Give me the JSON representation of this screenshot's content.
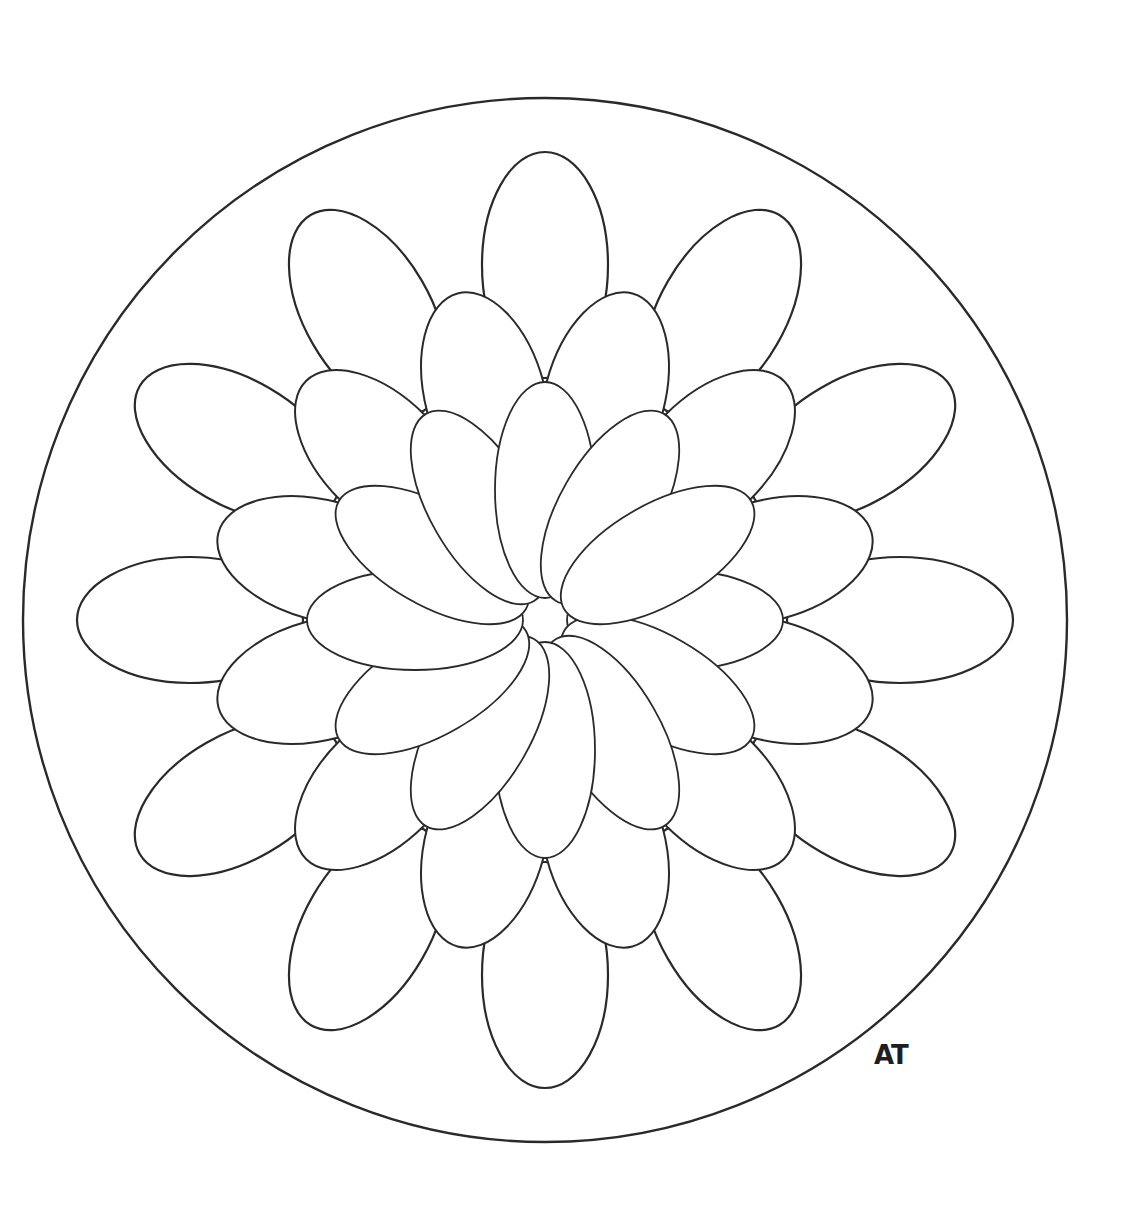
{
  "artwork": {
    "type": "mandala coloring page",
    "signature": "AT",
    "colors": {
      "background": "#ffffff",
      "line": "#2a2a2a"
    },
    "outer_circle": {
      "cx": 545,
      "cy": 620,
      "r": 522
    },
    "signature_position": {
      "x": 874,
      "y": 1040,
      "font_size": 26
    },
    "rings": [
      {
        "name": "outer",
        "count": 12,
        "dist": 355,
        "rx": 113,
        "ry": 63,
        "offset_deg": 0,
        "stroke": 2.2
      },
      {
        "name": "middle",
        "count": 12,
        "dist": 230,
        "rx": 108,
        "ry": 60,
        "offset_deg": 15,
        "stroke": 2.0
      },
      {
        "name": "inner",
        "count": 12,
        "dist": 130,
        "rx": 108,
        "ry": 50,
        "offset_deg": 0,
        "stroke": 1.8
      }
    ]
  }
}
